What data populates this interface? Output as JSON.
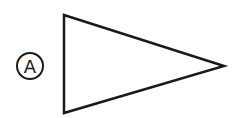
{
  "diagram": {
    "label": "A",
    "shape": "triangle",
    "stroke_color": "#1a1a1a",
    "background": "#ffffff"
  }
}
